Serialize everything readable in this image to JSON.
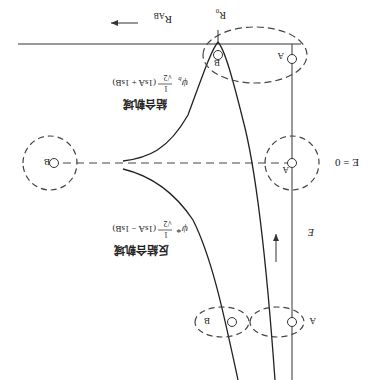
{
  "diagram": {
    "orientation": "rotated-180",
    "title": "",
    "axis_labels": {
      "distance": "R_AB",
      "energy": "E",
      "equilibrium": "R_0",
      "zero_energy": "E = 0"
    },
    "bonding": {
      "label": "結合軌域",
      "formula_symbol": "ψ_b",
      "formula_coef": "1/√2",
      "formula_body": "(1s_A + 1s_B)"
    },
    "antibonding": {
      "label": "反結合軌域",
      "formula_symbol": "ψ*",
      "formula_coef": "1/√2",
      "formula_body": "(1s_A − 1s_B)"
    },
    "atoms": {
      "A": "A",
      "B": "B"
    }
  },
  "text": {
    "r_ab": "R",
    "r_ab_sub": "AB",
    "r0": "R",
    "r0_sub": "0",
    "e_axis": "E",
    "e_zero": "E = 0",
    "bond_label": "結合軌域",
    "bond_psi": "ψ",
    "bond_psi_sub": "b",
    "bond_expr": "(1s",
    "anti_label": "反結合軌域",
    "anti_psi": "ψ*",
    "atom_a": "A",
    "atom_b": "B",
    "frac_num": "1",
    "frac_den": "√2",
    "bond_full": "(1sA + 1sB)",
    "anti_full": "(1sA − 1sB)"
  }
}
